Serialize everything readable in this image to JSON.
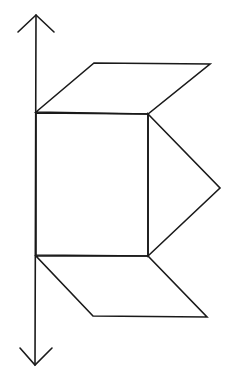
{
  "diagram": {
    "stroke_color": "#1a1a1a",
    "background": "#ffffff",
    "axis": {
      "x1": 36,
      "y1": 15,
      "x2": 35,
      "y2": 365,
      "head_top": [
        [
          18,
          32
        ],
        [
          36,
          15
        ],
        [
          54,
          32
        ]
      ],
      "head_bottom": [
        [
          20,
          348
        ],
        [
          35,
          365
        ],
        [
          52,
          348
        ]
      ]
    },
    "shapes": {
      "square": [
        [
          36,
          113
        ],
        [
          148,
          114
        ],
        [
          148,
          256
        ],
        [
          36,
          255
        ]
      ],
      "top_parallelogram": [
        [
          36,
          112
        ],
        [
          94,
          63
        ],
        [
          210,
          64
        ],
        [
          148,
          114
        ]
      ],
      "triangle": [
        [
          148,
          114
        ],
        [
          220,
          188
        ],
        [
          148,
          256
        ]
      ],
      "bottom_parallelogram": [
        [
          36,
          256
        ],
        [
          148,
          256
        ],
        [
          207,
          317
        ],
        [
          93,
          316
        ]
      ]
    }
  }
}
